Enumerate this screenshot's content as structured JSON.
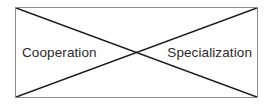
{
  "diagram": {
    "type": "crossed-box",
    "labels": {
      "left": "Cooperation",
      "right": "Specialization"
    },
    "colors": {
      "border": "#8b8b8b",
      "diagonal": "#1a1a1a",
      "text": "#2b2b2b",
      "background": "#ffffff"
    }
  }
}
